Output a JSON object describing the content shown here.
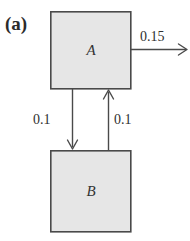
{
  "figure": {
    "panel_label": "(a)",
    "width": 190,
    "height": 241,
    "background_color": "#ffffff"
  },
  "colors": {
    "box_fill": "#e6e6e6",
    "box_stroke": "#4a4a4a",
    "arrow_stroke": "#4a4a4a",
    "text_color": "#2f2f2f",
    "panel_label_color": "#2b2b2b"
  },
  "compartments": [
    {
      "id": "compartment-a",
      "label": "A",
      "x": 50,
      "y": 11,
      "width": 81,
      "height": 78
    },
    {
      "id": "compartment-b",
      "label": "B",
      "x": 50,
      "y": 150,
      "width": 81,
      "height": 82
    }
  ],
  "flows": [
    {
      "id": "flow-a-out",
      "label": "0.15",
      "from": "A",
      "to": "external",
      "direction": "right",
      "value": 0.15
    },
    {
      "id": "flow-a-to-b",
      "label": "0.1",
      "from": "A",
      "to": "B",
      "direction": "down",
      "value": 0.1
    },
    {
      "id": "flow-b-to-a",
      "label": "0.1",
      "from": "B",
      "to": "A",
      "direction": "up",
      "value": 0.1
    }
  ]
}
